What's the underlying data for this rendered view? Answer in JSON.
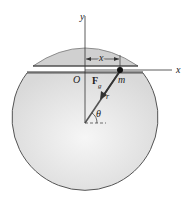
{
  "diagram": {
    "labels": {
      "y_axis": "y",
      "x_axis": "x",
      "origin": "O",
      "distance": "x",
      "force": "F",
      "force_subscript": "g",
      "mass": "m",
      "radius": "r",
      "angle": "θ"
    },
    "colors": {
      "sphere_fill": "#e6e6e6",
      "cap_fill": "#cfcfcf",
      "outline": "#555555",
      "tunnel": "#333333"
    }
  }
}
